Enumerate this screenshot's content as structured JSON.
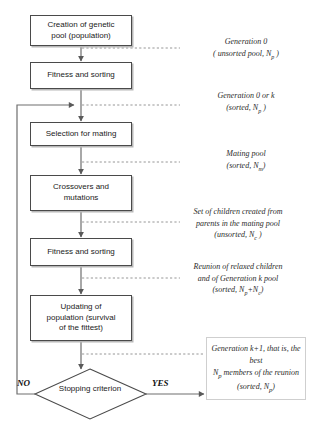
{
  "diagram": {
    "colors": {
      "box_border": "#4a4a4a",
      "box_shadow": "#b8b8b8",
      "flow_line": "#6e6e6e",
      "dashed_line": "#8a8a8a",
      "outbox_border": "#cfcfcf",
      "text": "#1a1a1a",
      "annotation_text": "#2b2b2b"
    },
    "nodes": [
      {
        "id": "creation",
        "line1": "Creation of genetic",
        "line2": "pool (population)"
      },
      {
        "id": "fitness1",
        "line1": "Fitness and sorting",
        "line2": ""
      },
      {
        "id": "selection",
        "line1": "Selection for mating",
        "line2": ""
      },
      {
        "id": "crossover",
        "line1": "Crossovers and",
        "line2": "mutations"
      },
      {
        "id": "fitness2",
        "line1": "Fitness and sorting",
        "line2": ""
      },
      {
        "id": "updating",
        "line1": "Updating of",
        "line2": "population (survival",
        "line3": "of the fittest)"
      }
    ],
    "decision": {
      "line1": "Stopping",
      "line2": "criterion",
      "no_label": "NO",
      "yes_label": "YES"
    },
    "annotations": [
      {
        "id": "gen0-unsorted",
        "line1_pre": "Generation 0",
        "line1_sub": "",
        "line1_post": "",
        "line2_pre": "( unsorted pool, N",
        "line2_sub": "p",
        "line2_post": " )"
      },
      {
        "id": "gen0-or-k",
        "line1_pre": "Generation 0  or k",
        "line1_sub": "",
        "line1_post": "",
        "line2_pre": "(sorted, N",
        "line2_sub": "p",
        "line2_post": " )"
      },
      {
        "id": "mating-pool",
        "line1_pre": "Mating pool",
        "line1_sub": "",
        "line1_post": "",
        "line2_pre": "(sorted, N",
        "line2_sub": "m",
        "line2_post": ")"
      },
      {
        "id": "children-set",
        "line0": "Set of children created from",
        "line1_pre": "parents in the mating pool",
        "line1_sub": "",
        "line1_post": "",
        "line2_pre": "(unsorted, N",
        "line2_sub": "c",
        "line2_post": " )"
      },
      {
        "id": "reunion",
        "line0": "Reunion  of  relaxed children",
        "line1_pre": "and of Generation k pool",
        "line1_sub": "",
        "line1_post": "",
        "line2_pre": "(sorted, N",
        "line2_sub": "p",
        "line2_post": "+N",
        "line2_sub2": "c",
        "line2_post2": ")"
      }
    ],
    "output_box": {
      "line1": "Generation k+1, that is, the best",
      "line2_pre": "N",
      "line2_sub": "p",
      "line2_post": " members of the reunion",
      "line3_pre": "(sorted, N",
      "line3_sub": "p",
      "line3_post": ")"
    }
  }
}
